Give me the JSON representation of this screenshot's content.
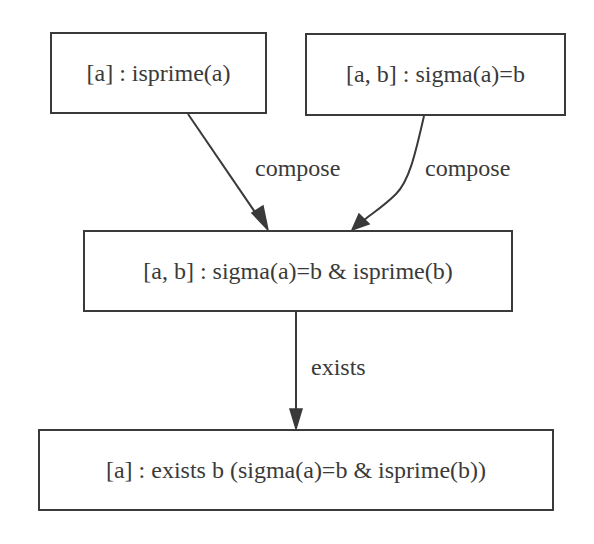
{
  "diagram": {
    "type": "directed-graph",
    "colors": {
      "stroke": "#3a3a3a",
      "background": "#ffffff",
      "text": "#3a3a3a"
    },
    "nodes": [
      {
        "id": "n1",
        "label": "[a] : isprime(a)"
      },
      {
        "id": "n2",
        "label": "[a, b] : sigma(a)=b"
      },
      {
        "id": "n3",
        "label": "[a, b] : sigma(a)=b & isprime(b)"
      },
      {
        "id": "n4",
        "label": "[a] : exists b (sigma(a)=b & isprime(b))"
      }
    ],
    "edges": [
      {
        "from": "n1",
        "to": "n3",
        "label": "compose"
      },
      {
        "from": "n2",
        "to": "n3",
        "label": "compose"
      },
      {
        "from": "n3",
        "to": "n4",
        "label": "exists"
      }
    ]
  }
}
